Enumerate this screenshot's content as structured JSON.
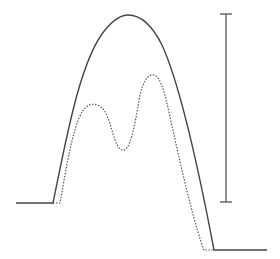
{
  "diagram": {
    "type": "waveform-comparison",
    "colors": {
      "solid_curve": "#444444",
      "dotted_curve": "#555555",
      "scale_bar": "#555555",
      "background": "#ffffff"
    },
    "curves": [
      {
        "name": "envelope",
        "style": "solid",
        "shape": "single-peak"
      },
      {
        "name": "double-peak",
        "style": "dotted",
        "shape": "two-peaks-with-valley"
      }
    ],
    "scale_bar": {
      "orientation": "vertical",
      "label": ""
    }
  }
}
